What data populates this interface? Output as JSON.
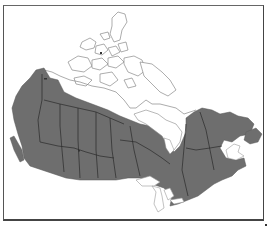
{
  "map": {
    "title": "",
    "region": "Canada",
    "legend": [],
    "colors": {
      "range_fill": "#6e6e6e",
      "range_border": "#2a2a2a",
      "coastline": "#888888",
      "background": "#ffffff",
      "frame": "#444444"
    },
    "features": {
      "shaded_range": "Distribution range (grey)",
      "unshaded": [
        "Arctic Archipelago",
        "Hudson Bay",
        "Great Lakes",
        "Northern tundra"
      ]
    }
  }
}
